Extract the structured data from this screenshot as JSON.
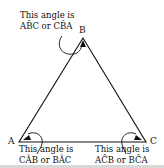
{
  "diagram": {
    "vertices": {
      "A": "A",
      "B": "B",
      "C": "C"
    },
    "annotations": {
      "top": {
        "line1": "This angle is",
        "line2": "AB̂C or CB̂A"
      },
      "left": {
        "line1": "This angle is",
        "line2": "CÂB or BÂC"
      },
      "right": {
        "line1": "This angle is",
        "line2": "AĈB or BĈA"
      }
    },
    "colors": {
      "stroke": "#111111",
      "background": "#ffffff"
    }
  }
}
